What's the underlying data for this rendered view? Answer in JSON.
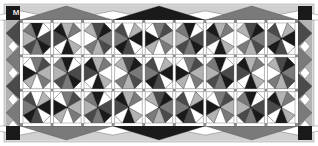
{
  "diagram": {
    "type": "quilt-layout",
    "corner_label": "M",
    "grid": {
      "columns": 9,
      "rows": 3
    },
    "colors": {
      "frame": "#d9d9d9",
      "black": "#1a1a1a",
      "dark": "#4a4a4a",
      "mid": "#7a7a7a",
      "light": "#b3b3b3",
      "pale": "#d0d0d0",
      "white": "#ffffff",
      "sashing": "#ffffff",
      "cornerstone": "#8c8c8c"
    },
    "top_border": {
      "triangles": [
        "mid",
        "black",
        "mid"
      ]
    },
    "bottom_border": {
      "triangles": [
        "mid",
        "black",
        "mid"
      ]
    },
    "corners": {
      "top_left": "black",
      "top_right": "black",
      "bottom_left": "black",
      "bottom_right": "black"
    }
  }
}
